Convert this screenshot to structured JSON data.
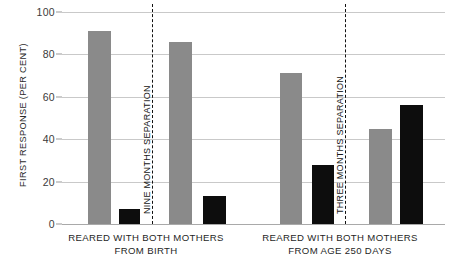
{
  "chart_data": {
    "type": "bar",
    "title": "",
    "xlabel": "",
    "ylabel": "FIRST RESPONSE (PER CENT)",
    "ylim": [
      0,
      100
    ],
    "yticks": [
      0,
      20,
      40,
      60,
      80,
      100
    ],
    "ytick_labels": [
      "0",
      "20",
      "40",
      "60",
      "80",
      "100"
    ],
    "grid": true,
    "legend": "none",
    "bar_colors": {
      "gray": "#8a8a8a",
      "black": "#0d0d0d"
    },
    "categories": [
      "Reared with both mothers from birth — before nine months separation (gray)",
      "Reared with both mothers from birth — before nine months separation (black)",
      "Reared with both mothers from birth — after nine months separation (gray)",
      "Reared with both mothers from birth — after nine months separation (black)",
      "Reared with both mothers from age 250 days — before three months separation (gray)",
      "Reared with both mothers from age 250 days — before three months separation (black)",
      "Reared with both mothers from age 250 days — after three months separation (gray)",
      "Reared with both mothers from age 250 days — after three months separation (black)"
    ],
    "values": [
      91,
      7,
      86,
      13,
      71,
      28,
      45,
      56
    ],
    "bars": [
      {
        "value": 91,
        "color": "gray",
        "x": 26,
        "width": 23
      },
      {
        "value": 7,
        "color": "black",
        "x": 57,
        "width": 21
      },
      {
        "value": 86,
        "color": "gray",
        "x": 107,
        "width": 23
      },
      {
        "value": 13,
        "color": "black",
        "x": 141,
        "width": 23
      },
      {
        "value": 71,
        "color": "gray",
        "x": 218,
        "width": 22
      },
      {
        "value": 28,
        "color": "black",
        "x": 250,
        "width": 22
      },
      {
        "value": 45,
        "color": "gray",
        "x": 307,
        "width": 23
      },
      {
        "value": 56,
        "color": "black",
        "x": 338,
        "width": 23
      }
    ],
    "separators": [
      {
        "label": "NINE MONTHS SEPARATION",
        "x": 90
      },
      {
        "label": "THREE MONTHS SEPARATION",
        "x": 283
      }
    ],
    "groups": [
      {
        "line1": "REARED WITH BOTH MOTHERS",
        "line2": "FROM BIRTH",
        "center": 84
      },
      {
        "line1": "REARED WITH BOTH MOTHERS",
        "line2": "FROM AGE 250 DAYS",
        "center": 278
      }
    ]
  }
}
